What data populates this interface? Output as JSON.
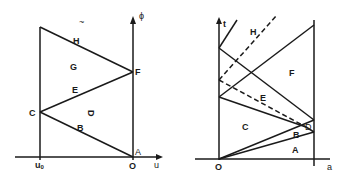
{
  "left_diagram": {
    "axis_vertical_label": "ϕ",
    "axis_horizontal_label": "u",
    "origin_label": "O",
    "u0_label": "u",
    "u0_subscript": "0",
    "point_labels": {
      "A": "A",
      "C": "C",
      "F": "F"
    },
    "region_labels": {
      "B": "B",
      "D": "D",
      "E": "E",
      "G": "G",
      "H": "H"
    },
    "stray_mark": "~"
  },
  "right_diagram": {
    "axis_vertical_label": "t",
    "axis_horizontal_label": "a",
    "origin_label": "O",
    "region_labels": {
      "A": "A",
      "B": "B",
      "C": "C",
      "D": "D",
      "E": "E",
      "F": "F",
      "H": "H"
    }
  },
  "caption": ""
}
